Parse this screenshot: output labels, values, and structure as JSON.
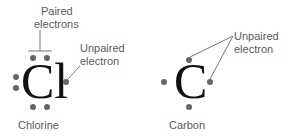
{
  "diagram": {
    "atoms": [
      {
        "name": "Chlorine",
        "symbol": "Cl",
        "valence_electrons": 7,
        "annotations": [
          {
            "text_line1": "Paired",
            "text_line2": "electrons"
          },
          {
            "text_line1": "Unpaired",
            "text_line2": "electron"
          }
        ]
      },
      {
        "name": "Carbon",
        "symbol": "C",
        "valence_electrons": 4,
        "annotations": [
          {
            "text_line1": "Unpaired",
            "text_line2": "electron"
          }
        ]
      }
    ],
    "colors": {
      "symbol": "#111111",
      "dot": "#666666",
      "label": "#5a5a5a",
      "line": "#777777"
    }
  }
}
